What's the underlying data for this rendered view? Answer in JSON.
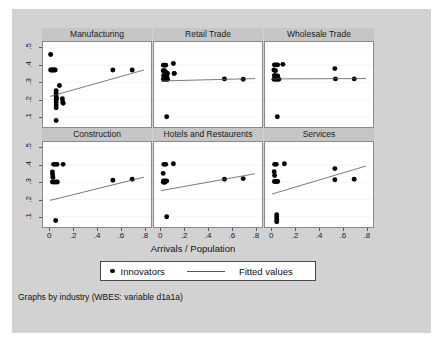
{
  "figure": {
    "note": "Graphs by industry (WBES: variable d1a1a)",
    "xaxis_title": "Arrivals / Population"
  },
  "legend": {
    "marker_label": "Innovators",
    "line_label": "Fitted values"
  },
  "chart_data": {
    "type": "scatter",
    "title": "",
    "subtitle": "",
    "xlabel": "Arrivals / Population",
    "ylabel": "",
    "xlim": [
      -0.06,
      0.86
    ],
    "ylim": [
      0.04,
      0.535
    ],
    "xticks": [
      0,
      0.2,
      0.4,
      0.6,
      0.8
    ],
    "xtick_labels": [
      "0",
      ".2",
      ".4",
      ".6",
      ".8"
    ],
    "yticks": [
      0.1,
      0.2,
      0.3,
      0.4,
      0.5
    ],
    "ytick_labels": [
      ".1",
      ".2",
      ".3",
      ".4",
      ".5"
    ],
    "grid": false,
    "legend_position": "bottom-center",
    "legend_entries": [
      "Innovators",
      "Fitted values"
    ],
    "note": "Graphs by industry (WBES: variable d1a1a)",
    "marker_color": "#000000",
    "line_color": "#555555",
    "panel_layout": [
      2,
      3
    ],
    "panels": [
      {
        "title": "Manufacturing",
        "row": 0,
        "col": 0,
        "series": [
          {
            "name": "Innovators",
            "type": "scatter",
            "x": [
              0.005,
              0.005,
              0.012,
              0.02,
              0.028,
              0.036,
              0.044,
              0.052,
              0.052,
              0.052,
              0.052,
              0.052,
              0.052,
              0.052,
              0.052,
              0.055,
              0.08,
              0.105,
              0.108,
              0.112,
              0.535,
              0.7
            ],
            "y": [
              0.462,
              0.372,
              0.372,
              0.372,
              0.372,
              0.372,
              0.372,
              0.252,
              0.235,
              0.218,
              0.2,
              0.185,
              0.168,
              0.152,
              0.078,
              0.205,
              0.282,
              0.205,
              0.186,
              0.178,
              0.372,
              0.372
            ]
          },
          {
            "name": "Fitted values",
            "type": "line",
            "x": [
              0.0,
              0.8
            ],
            "y": [
              0.218,
              0.372
            ]
          }
        ]
      },
      {
        "title": "Retail Trade",
        "row": 0,
        "col": 1,
        "series": [
          {
            "name": "Innovators",
            "type": "scatter",
            "x": [
              0.02,
              0.03,
              0.04,
              0.018,
              0.03,
              0.045,
              0.055,
              0.022,
              0.035,
              0.048,
              0.02,
              0.032,
              0.044,
              0.056,
              0.105,
              0.112,
              0.112,
              0.048,
              0.54,
              0.7
            ],
            "y": [
              0.4,
              0.4,
              0.4,
              0.368,
              0.368,
              0.358,
              0.352,
              0.34,
              0.336,
              0.336,
              0.318,
              0.318,
              0.318,
              0.318,
              0.41,
              0.352,
              0.352,
              0.1,
              0.32,
              0.318
            ]
          },
          {
            "name": "Fitted values",
            "type": "line",
            "x": [
              0.0,
              0.8
            ],
            "y": [
              0.308,
              0.322
            ]
          }
        ]
      },
      {
        "title": "Wholesale Trade",
        "row": 0,
        "col": 2,
        "series": [
          {
            "name": "Innovators",
            "type": "scatter",
            "x": [
              0.02,
              0.034,
              0.048,
              0.016,
              0.03,
              0.02,
              0.034,
              0.048,
              0.016,
              0.03,
              0.044,
              0.058,
              0.092,
              0.045,
              0.535,
              0.54,
              0.7
            ],
            "y": [
              0.402,
              0.402,
              0.402,
              0.372,
              0.368,
              0.34,
              0.338,
              0.338,
              0.318,
              0.318,
              0.318,
              0.318,
              0.405,
              0.1,
              0.38,
              0.32,
              0.32
            ]
          },
          {
            "name": "Fitted values",
            "type": "line",
            "x": [
              0.0,
              0.8
            ],
            "y": [
              0.32,
              0.322
            ]
          }
        ]
      },
      {
        "title": "Construction",
        "row": 1,
        "col": 0,
        "series": [
          {
            "name": "Innovators",
            "type": "scatter",
            "x": [
              0.03,
              0.045,
              0.06,
              0.02,
              0.022,
              0.024,
              0.02,
              0.034,
              0.048,
              0.062,
              0.112,
              0.048,
              0.535,
              0.7
            ],
            "y": [
              0.405,
              0.405,
              0.405,
              0.36,
              0.345,
              0.33,
              0.302,
              0.302,
              0.302,
              0.302,
              0.405,
              0.078,
              0.312,
              0.318
            ]
          },
          {
            "name": "Fitted values",
            "type": "line",
            "x": [
              0.0,
              0.8
            ],
            "y": [
              0.195,
              0.33
            ]
          }
        ]
      },
      {
        "title": "Hotels and Restaurents",
        "row": 1,
        "col": 1,
        "series": [
          {
            "name": "Innovators",
            "type": "scatter",
            "x": [
              0.024,
              0.04,
              0.018,
              0.02,
              0.034,
              0.048,
              0.02,
              0.034,
              0.105,
              0.048,
              0.54,
              0.7
            ],
            "y": [
              0.405,
              0.405,
              0.352,
              0.308,
              0.308,
              0.308,
              0.3,
              0.3,
              0.408,
              0.1,
              0.318,
              0.322
            ]
          },
          {
            "name": "Fitted values",
            "type": "line",
            "x": [
              0.0,
              0.8
            ],
            "y": [
              0.252,
              0.35
            ]
          }
        ]
      },
      {
        "title": "Services",
        "row": 1,
        "col": 2,
        "series": [
          {
            "name": "Innovators",
            "type": "scatter",
            "x": [
              0.022,
              0.036,
              0.018,
              0.022,
              0.02,
              0.034,
              0.048,
              0.105,
              0.04,
              0.04,
              0.04,
              0.04,
              0.535,
              0.535,
              0.7
            ],
            "y": [
              0.405,
              0.405,
              0.362,
              0.34,
              0.305,
              0.305,
              0.305,
              0.408,
              0.112,
              0.098,
              0.084,
              0.07,
              0.38,
              0.315,
              0.318
            ]
          },
          {
            "name": "Fitted values",
            "type": "line",
            "x": [
              0.0,
              0.8
            ],
            "y": [
              0.232,
              0.395
            ]
          }
        ]
      }
    ]
  }
}
